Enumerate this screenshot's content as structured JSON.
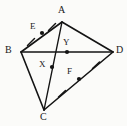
{
  "figure": {
    "name": "quadrilateral-kite-abdc-with-diagonals",
    "canvas": {
      "width": 127,
      "height": 126
    },
    "background_color": "#fbfbf9",
    "stroke_color": "#141414",
    "label_color": "#1a1a1a",
    "vertices": [
      {
        "id": "A",
        "label": "A",
        "x": 62,
        "y": 22,
        "label_x": 58,
        "label_y": 5
      },
      {
        "id": "B",
        "label": "B",
        "x": 21,
        "y": 52,
        "label_x": 5,
        "label_y": 45
      },
      {
        "id": "D",
        "label": "D",
        "x": 113,
        "y": 52,
        "label_x": 116,
        "label_y": 45
      },
      {
        "id": "C",
        "label": "C",
        "x": 44,
        "y": 110,
        "label_x": 40,
        "label_y": 112
      }
    ],
    "marked_points": [
      {
        "id": "E",
        "label": "E",
        "x": 42,
        "y": 33,
        "label_x": 30,
        "label_y": 21,
        "on_segment": "B-A"
      },
      {
        "id": "Y",
        "label": "Y",
        "x": 67,
        "y": 52,
        "label_x": 63,
        "label_y": 37,
        "on_segment": "B-D"
      },
      {
        "id": "X",
        "label": "X",
        "x": 52,
        "y": 67,
        "label_x": 39,
        "label_y": 59,
        "on_segment": "A-C"
      },
      {
        "id": "F",
        "label": "F",
        "x": 79,
        "y": 79,
        "label_x": 67,
        "label_y": 66,
        "on_segment": "C-D"
      }
    ],
    "segments": [
      {
        "id": "B-A",
        "from": "B",
        "to": "A"
      },
      {
        "id": "A-D",
        "from": "A",
        "to": "D"
      },
      {
        "id": "B-C",
        "from": "B",
        "to": "C"
      },
      {
        "id": "C-D",
        "from": "C",
        "to": "D"
      },
      {
        "id": "B-D",
        "from": "B",
        "to": "D",
        "kind": "diagonal"
      },
      {
        "id": "A-C",
        "from": "A",
        "to": "C",
        "kind": "diagonal"
      }
    ],
    "tick_marks": [
      {
        "id": "tick-BE",
        "x": 31,
        "y": 42,
        "angle": -36
      },
      {
        "id": "tick-EA",
        "x": 52,
        "y": 27,
        "angle": -36
      },
      {
        "id": "tick-CF",
        "x": 62,
        "y": 94,
        "angle": -43
      },
      {
        "id": "tick-FD",
        "x": 96,
        "y": 65,
        "angle": -43
      }
    ]
  }
}
